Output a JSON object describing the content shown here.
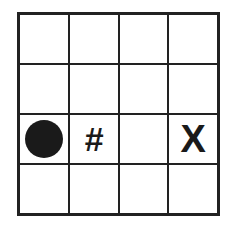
{
  "grid": {
    "rows": 4,
    "cols": 4,
    "cells": [
      [
        "",
        "",
        "",
        ""
      ],
      [
        "",
        "",
        "",
        ""
      ],
      [
        "circle",
        "#",
        "",
        "X"
      ],
      [
        "",
        "",
        "",
        ""
      ]
    ]
  },
  "symbols": {
    "hash": "#",
    "x": "X"
  },
  "colors": {
    "line": "#222222",
    "fill": "#1a1a1a",
    "background": "#ffffff"
  }
}
